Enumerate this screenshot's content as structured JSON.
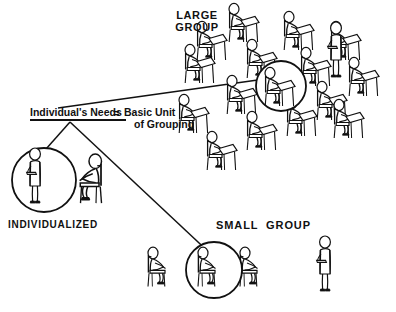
{
  "diagram": {
    "title_text": "Individual's Needs = Basic Unit of Grouping",
    "background_color": "#ffffff",
    "ink_color": "#111111",
    "center_label": {
      "needs_text": "Individual's Needs",
      "equals_sign": "=",
      "basic_unit_line1": "Basic Unit",
      "basic_unit_line2": "of Grouping"
    },
    "nodes": [
      {
        "id": "individualized",
        "label": "INDIVIDUALIZED",
        "seated_students": 1,
        "standing_teachers": 1,
        "circled_figures": 1
      },
      {
        "id": "large-group",
        "label_line1": "LARGE",
        "label_line2": "GROUP",
        "label": "LARGE GROUP",
        "seated_students": 15,
        "standing_teachers": 1,
        "circled_figures": 1
      },
      {
        "id": "small-group",
        "label": "SMALL  GROUP",
        "seated_students": 3,
        "standing_teachers": 1,
        "circled_figures": 1
      }
    ],
    "connectors": [
      {
        "from": "center-label",
        "to": "large-group"
      },
      {
        "from": "center-label",
        "to": "individualized"
      },
      {
        "from": "center-label",
        "to": "small-group"
      }
    ]
  }
}
